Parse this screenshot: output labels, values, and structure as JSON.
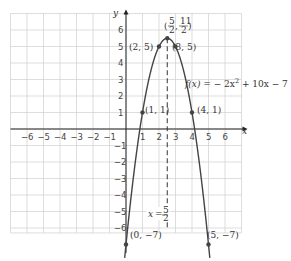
{
  "chart_data": {
    "type": "line",
    "title": "",
    "function_label": "f(x) = -2x² + 10x - 7",
    "function_parts": {
      "f": "f(x)",
      "eq": " = − 2x",
      "sup": "2",
      "rest": " + 10x − 7"
    },
    "xlabel": "x",
    "ylabel": "y",
    "xlim": [
      -7,
      7
    ],
    "ylim": [
      -7,
      7
    ],
    "grid": true,
    "x_ticks": [
      "−6",
      "−5",
      "−4",
      "−3",
      "−2",
      "−1",
      "1",
      "2",
      "3",
      "4",
      "5",
      "6"
    ],
    "y_ticks": [
      "6",
      "5",
      "4",
      "3",
      "2",
      "1",
      "−1",
      "−2",
      "−3",
      "−4",
      "−5",
      "−6"
    ],
    "points": [
      {
        "x": 0,
        "y": -7,
        "label": "(0, −7)"
      },
      {
        "x": 1,
        "y": 1,
        "label": "(1, 1)"
      },
      {
        "x": 2,
        "y": 5,
        "label": "(2, 5)"
      },
      {
        "x": 2.5,
        "y": 5.5,
        "label": "(5/2, 11/2)"
      },
      {
        "x": 3,
        "y": 5,
        "label": "(3, 5)"
      },
      {
        "x": 4,
        "y": 1,
        "label": "(4, 1)"
      },
      {
        "x": 5,
        "y": -7,
        "label": "(5, −7)"
      }
    ],
    "axis_of_symmetry": {
      "x": 2.5,
      "label": "x = 5/2"
    },
    "vertex_label": {
      "num_x": "5",
      "den_x": "2",
      "num_y": "11",
      "den_y": "2"
    },
    "colors": {
      "curve": "#444444",
      "grid": "#cfcfcf",
      "axis": "#222222"
    }
  },
  "labels": {
    "p0": "(0, −7)",
    "p1": "(1, 1)",
    "p2": "(2, 5)",
    "p3": "(3, 5)",
    "p4": "(4, 1)",
    "p5": "(5, −7)",
    "sym": "x = ",
    "sym_num": "5",
    "sym_den": "2",
    "x_axis": "x",
    "y_axis": "y"
  }
}
